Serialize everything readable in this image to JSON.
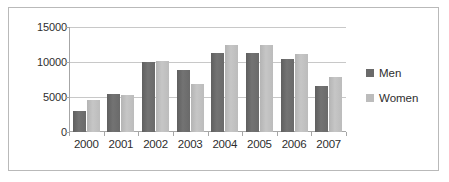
{
  "chart_data": {
    "type": "bar",
    "title": "",
    "xlabel": "",
    "ylabel": "",
    "categories": [
      "2000",
      "2001",
      "2002",
      "2003",
      "2004",
      "2005",
      "2006",
      "2007"
    ],
    "series": [
      {
        "name": "Men",
        "color": "#6a6a6a",
        "values": [
          3000,
          5500,
          9950,
          8800,
          11350,
          11250,
          10400,
          6600
        ]
      },
      {
        "name": "Women",
        "color": "#bcbcbc",
        "values": [
          4600,
          5350,
          10200,
          6900,
          12500,
          12500,
          11100,
          7900
        ]
      }
    ],
    "ylim": [
      0,
      15000
    ],
    "yticks": [
      0,
      5000,
      10000,
      15000
    ],
    "ytick_labels": [
      "0",
      "5000",
      "10000",
      "15000"
    ],
    "grid": true,
    "legend_position": "right"
  },
  "legend": {
    "items": [
      {
        "label": "Men"
      },
      {
        "label": "Women"
      }
    ]
  }
}
